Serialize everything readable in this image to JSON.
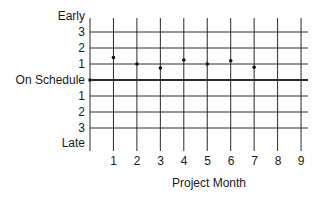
{
  "chart_data": {
    "type": "scatter",
    "title": "",
    "xlabel": "Project Month",
    "ylabel": "",
    "x_ticks": [
      "1",
      "2",
      "3",
      "4",
      "5",
      "6",
      "7",
      "8",
      "9"
    ],
    "y_tick_labels_top_to_bottom": [
      "Early",
      "3",
      "2",
      "1",
      "On Schedule",
      "1",
      "2",
      "3",
      "Late"
    ],
    "xlim": [
      0,
      9
    ],
    "ylim": [
      -4,
      4
    ],
    "grid": true,
    "legend": null,
    "series": [
      {
        "name": "Schedule variance",
        "x": [
          0,
          1,
          2,
          3,
          4,
          5,
          6,
          7
        ],
        "y": [
          0,
          1.4,
          1.0,
          0.75,
          1.25,
          1.0,
          1.2,
          0.8
        ]
      }
    ]
  },
  "labels": {
    "y": {
      "early": "Early",
      "early3": "3",
      "early2": "2",
      "early1": "1",
      "on_schedule": "On Schedule",
      "late1": "1",
      "late2": "2",
      "late3": "3",
      "late": "Late"
    },
    "x": [
      "1",
      "2",
      "3",
      "4",
      "5",
      "6",
      "7",
      "8",
      "9"
    ],
    "x_title": "Project Month"
  },
  "colors": {
    "grid": "#2a2a2a",
    "points": "#111111",
    "text": "#1a1a1a"
  }
}
